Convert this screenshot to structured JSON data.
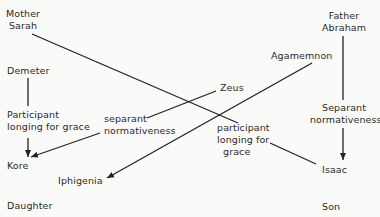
{
  "diagram": {
    "nodes": {
      "mother_sarah": {
        "line1": "Mother",
        "line2": "Sarah"
      },
      "demeter": {
        "label": "Demeter"
      },
      "participant_left": {
        "line1": "Participant",
        "line2": "longing for grace"
      },
      "kore": {
        "label": "Kore"
      },
      "separant_center": {
        "line1": "separant",
        "line2": "normativeness"
      },
      "zeus": {
        "label": "Zeus"
      },
      "agamemnon": {
        "label": "Agamemnon"
      },
      "iphigenia": {
        "label": "Iphigenia"
      },
      "father_abraham": {
        "line1": "Father",
        "line2": "Abraham"
      },
      "separant_right": {
        "line1": "Separant",
        "line2": "normativeness"
      },
      "participant_center": {
        "line1": "participant",
        "line2": "longing for",
        "line3": "grace"
      },
      "isaac": {
        "label": "Isaac"
      },
      "daughter": {
        "label": "Daughter"
      },
      "son": {
        "label": "Son"
      }
    },
    "edges": [
      {
        "from": "mother_sarah",
        "to": "participant_center",
        "arrow": false
      },
      {
        "from": "demeter",
        "to": "participant_left",
        "arrow": false
      },
      {
        "from": "participant_left",
        "to": "kore",
        "arrow": true
      },
      {
        "from": "separant_center",
        "to": "kore",
        "arrow": true
      },
      {
        "from": "zeus",
        "to": "separant_center",
        "arrow": false
      },
      {
        "from": "agamemnon",
        "to": "iphigenia",
        "arrow": true
      },
      {
        "from": "father_abraham",
        "to": "separant_right",
        "arrow": false
      },
      {
        "from": "separant_right",
        "to": "isaac",
        "arrow": true
      },
      {
        "from": "participant_center",
        "to": "isaac",
        "arrow": false
      }
    ]
  }
}
